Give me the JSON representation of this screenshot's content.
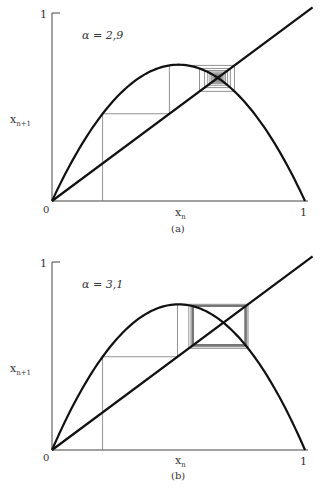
{
  "chart_data": [
    {
      "type": "line",
      "title": "Cobweb diagram of logistic map",
      "panel_label": "(a)",
      "annotation": "α = 2,9",
      "alpha": 2.9,
      "x0": 0.2,
      "iterations": 60,
      "xlabel": "x_n",
      "ylabel": "x_{n+1}",
      "x_ticks": [
        "0",
        "1"
      ],
      "y_ticks": [
        "1"
      ],
      "xlim": [
        0,
        1
      ],
      "ylim": [
        0,
        1
      ],
      "series": [
        {
          "name": "f(x) = αx(1−x)",
          "style": "thick"
        },
        {
          "name": "y = x",
          "style": "thick"
        },
        {
          "name": "cobweb",
          "style": "thin"
        }
      ],
      "grid": false
    },
    {
      "type": "line",
      "title": "Cobweb diagram of logistic map",
      "panel_label": "(b)",
      "annotation": "α = 3,1",
      "alpha": 3.1,
      "x0": 0.2,
      "iterations": 60,
      "xlabel": "x_n",
      "ylabel": "x_{n+1}",
      "x_ticks": [
        "0",
        "1"
      ],
      "y_ticks": [
        "1"
      ],
      "xlim": [
        0,
        1
      ],
      "ylim": [
        0,
        1
      ],
      "series": [
        {
          "name": "f(x) = αx(1−x)",
          "style": "thick"
        },
        {
          "name": "y = x",
          "style": "thick"
        },
        {
          "name": "cobweb",
          "style": "thin"
        }
      ],
      "grid": false
    }
  ],
  "panels": {
    "a": {
      "label": "(a)",
      "annotation": "α = 2,9",
      "zero": "0",
      "one_x": "1",
      "one_y": "1",
      "xn": "x",
      "xn_sub": "n",
      "xn1": "x",
      "xn1_sub": "n+1"
    },
    "b": {
      "label": "(b)",
      "annotation": "α = 3,1",
      "zero": "0",
      "one_x": "1",
      "one_y": "1",
      "xn": "x",
      "xn_sub": "n",
      "xn1": "x",
      "xn1_sub": "n+1"
    }
  }
}
